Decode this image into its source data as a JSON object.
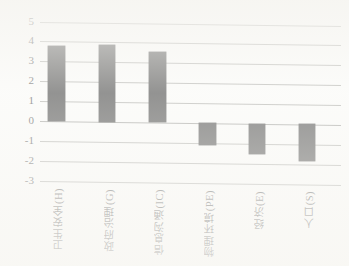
{
  "chart_data": {
    "type": "bar",
    "title": "",
    "subtitle": "",
    "xlabel": "",
    "ylabel": "",
    "ylim": [
      -3,
      5
    ],
    "ytick_step": 1,
    "yticks": [
      5,
      4,
      3,
      2,
      1,
      0,
      -1,
      -2,
      -3
    ],
    "ytick_labels": [
      "5",
      "4",
      "3",
      "2",
      "1",
      "0",
      "-1",
      "-2",
      "-3"
    ],
    "grid": true,
    "grid_axis": "y",
    "legend": "none",
    "bar_color": "#131313",
    "categories": [
      "卫生安全(H)",
      "政府治理(G)",
      "信息沟通(IC)",
      "物理环境(PE)",
      "经济(E)",
      "人口(S)"
    ],
    "values": [
      3.75,
      3.85,
      3.55,
      -1.1,
      -1.55,
      -1.85
    ],
    "annotations": []
  },
  "axis": {
    "y_top_label": "5",
    "y_bottom_label": "-3"
  }
}
